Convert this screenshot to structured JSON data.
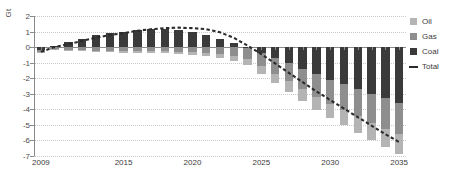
{
  "chart_data": {
    "type": "bar",
    "title": "",
    "subtitle": "",
    "xlabel": "",
    "ylabel": "Gt",
    "unit_label": "Gt",
    "stacked": true,
    "grid": true,
    "legend_position": "right",
    "x": [
      2009,
      2010,
      2011,
      2012,
      2013,
      2014,
      2015,
      2016,
      2017,
      2018,
      2019,
      2020,
      2021,
      2022,
      2023,
      2024,
      2025,
      2026,
      2027,
      2028,
      2029,
      2030,
      2031,
      2032,
      2033,
      2034,
      2035
    ],
    "categories": [
      "2009",
      "2010",
      "2011",
      "2012",
      "2013",
      "2014",
      "2015",
      "2016",
      "2017",
      "2018",
      "2019",
      "2020",
      "2021",
      "2022",
      "2023",
      "2024",
      "2025",
      "2026",
      "2027",
      "2028",
      "2029",
      "2030",
      "2031",
      "2032",
      "2033",
      "2034",
      "2035"
    ],
    "xtick_labels": [
      "2009",
      "2015",
      "2020",
      "2025",
      "2030",
      "2035"
    ],
    "xtick_values": [
      2009,
      2015,
      2020,
      2025,
      2030,
      2035
    ],
    "ytick_labels": [
      "2",
      "1",
      "0",
      "-1",
      "-2",
      "-3",
      "-4",
      "-5",
      "-6",
      "-7"
    ],
    "ytick_values": [
      2,
      1,
      0,
      -1,
      -2,
      -3,
      -4,
      -5,
      -6,
      -7
    ],
    "ylim": [
      -7,
      2
    ],
    "xlim": [
      2008.5,
      2035.5
    ],
    "series": [
      {
        "name": "Coal",
        "color": "#3a3a3a",
        "values": [
          -0.2,
          0.1,
          0.3,
          0.55,
          0.75,
          0.9,
          1.0,
          1.1,
          1.15,
          1.15,
          1.1,
          1.0,
          0.8,
          0.55,
          0.25,
          -0.05,
          -0.35,
          -0.7,
          -1.05,
          -1.4,
          -1.75,
          -2.1,
          -2.4,
          -2.7,
          -3.0,
          -3.3,
          -3.6
        ]
      },
      {
        "name": "Gas",
        "color": "#8e8e8e",
        "values": [
          -0.1,
          -0.15,
          -0.18,
          -0.2,
          -0.22,
          -0.24,
          -0.26,
          -0.28,
          -0.28,
          -0.28,
          -0.3,
          -0.32,
          -0.38,
          -0.45,
          -0.55,
          -0.7,
          -0.85,
          -1.0,
          -1.15,
          -1.3,
          -1.45,
          -1.55,
          -1.65,
          -1.75,
          -1.85,
          -1.95,
          -2.0
        ]
      },
      {
        "name": "Oil",
        "color": "#b4b4b4",
        "values": [
          -0.05,
          -0.05,
          -0.06,
          -0.07,
          -0.08,
          -0.09,
          -0.1,
          -0.11,
          -0.12,
          -0.13,
          -0.15,
          -0.18,
          -0.22,
          -0.28,
          -0.35,
          -0.42,
          -0.5,
          -0.58,
          -0.66,
          -0.74,
          -0.82,
          -0.9,
          -0.98,
          -1.05,
          -1.12,
          -1.18,
          -1.25
        ]
      }
    ],
    "total_series": {
      "name": "Total",
      "style": "dashed",
      "color": "#2b2b2b",
      "values": [
        -0.3,
        0.0,
        0.2,
        0.4,
        0.6,
        0.78,
        0.9,
        1.05,
        1.15,
        1.22,
        1.25,
        1.22,
        1.15,
        0.95,
        0.6,
        0.1,
        -0.45,
        -1.05,
        -1.65,
        -2.25,
        -2.85,
        -3.4,
        -3.95,
        -4.5,
        -5.05,
        -5.6,
        -6.1
      ]
    },
    "legend": [
      {
        "label": "Oil",
        "color": "#b4b4b4",
        "style": "swatch"
      },
      {
        "label": "Gas",
        "color": "#8e8e8e",
        "style": "swatch"
      },
      {
        "label": "Coal",
        "color": "#3a3a3a",
        "style": "swatch"
      },
      {
        "label": "Total",
        "color": "#2b2b2b",
        "style": "dashed-line"
      }
    ]
  }
}
